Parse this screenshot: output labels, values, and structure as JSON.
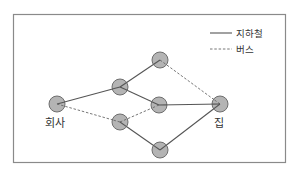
{
  "diagram": {
    "title": "",
    "legend": {
      "items": [
        {
          "type": "subway",
          "line_style": "solid",
          "label": "지하철"
        },
        {
          "type": "bus",
          "line_style": "dashed",
          "label": "버스"
        }
      ]
    },
    "nodes": [
      {
        "id": "company",
        "label": "회사"
      },
      {
        "id": "a",
        "label": ""
      },
      {
        "id": "b",
        "label": ""
      },
      {
        "id": "top",
        "label": ""
      },
      {
        "id": "mid",
        "label": ""
      },
      {
        "id": "bottom",
        "label": ""
      },
      {
        "id": "home",
        "label": "집"
      }
    ],
    "edges": [
      {
        "from": "company",
        "to": "a",
        "type": "subway"
      },
      {
        "from": "company",
        "to": "b",
        "type": "bus"
      },
      {
        "from": "a",
        "to": "top",
        "type": "subway"
      },
      {
        "from": "a",
        "to": "mid",
        "type": "subway"
      },
      {
        "from": "b",
        "to": "mid",
        "type": "bus"
      },
      {
        "from": "b",
        "to": "bottom",
        "type": "subway"
      },
      {
        "from": "top",
        "to": "home",
        "type": "bus"
      },
      {
        "from": "mid",
        "to": "home",
        "type": "subway"
      },
      {
        "from": "bottom",
        "to": "home",
        "type": "subway"
      }
    ],
    "colors": {
      "node_fill": "#b4b4b4",
      "node_stroke": "#6e6e6e",
      "line": "#555555"
    }
  }
}
